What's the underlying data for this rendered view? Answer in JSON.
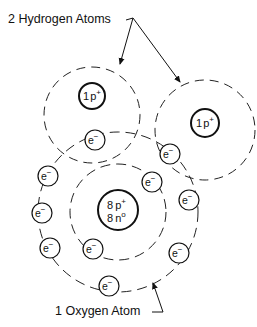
{
  "labels": {
    "hydrogen": "2 Hydrogen Atoms",
    "oxygen": "1 Oxygen Atom"
  },
  "hydrogen_atoms": [
    {
      "nucleus": {
        "count": "1",
        "particle": "p",
        "charge": "+"
      }
    },
    {
      "nucleus": {
        "count": "1",
        "particle": "p",
        "charge": "+"
      }
    }
  ],
  "oxygen_atom": {
    "nucleus": {
      "protons": {
        "count": "8",
        "particle": "p",
        "charge": "+"
      },
      "neutrons": {
        "count": "8",
        "particle": "n",
        "charge": "o"
      }
    },
    "shells": [
      "inner",
      "outer"
    ]
  },
  "electron": {
    "symbol": "e",
    "charge": "−"
  },
  "electron_count": 10,
  "colors": {
    "ink": "#111111",
    "background": "#ffffff"
  }
}
